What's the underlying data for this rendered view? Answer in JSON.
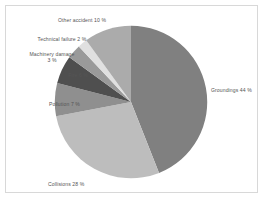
{
  "chart_data": {
    "type": "pie",
    "title": "",
    "subtitle": "",
    "xlabel": "",
    "ylabel": "",
    "legend_position": "none",
    "grid": false,
    "units": "%",
    "start_angle_deg": 0,
    "direction": "clockwise",
    "categories": [
      "Groundings",
      "Collisions",
      "Pollution",
      "Fire",
      "Machinery damage",
      "Technical failure",
      "Other accident"
    ],
    "values": [
      44,
      28,
      7,
      6,
      3,
      2,
      10
    ],
    "slices": [
      {
        "name": "Groundings",
        "value": 44,
        "label": "Groundings 44 %",
        "color": "#808080"
      },
      {
        "name": "Collisions",
        "value": 28,
        "label": "Collisions 28 %",
        "color": "#bdbdbd"
      },
      {
        "name": "Pollution",
        "value": 7,
        "label": "Pollution 7 %",
        "color": "#8f8f8f"
      },
      {
        "name": "Fire",
        "value": 6,
        "label": "Fire 6 %",
        "color": "#4f4f4f"
      },
      {
        "name": "Machinery damage",
        "value": 3,
        "label": "Machinery damage 3 %",
        "color": "#9a9a9a"
      },
      {
        "name": "Technical failure",
        "value": 2,
        "label": "Technical failure 2 %",
        "color": "#e0e0e0"
      },
      {
        "name": "Other accident",
        "value": 10,
        "label": "Other accident 10 %",
        "color": "#ababab"
      }
    ]
  },
  "labels": {
    "groundings": "Groundings 44 %",
    "collisions": "Collisions 28 %",
    "pollution": "Pollution 7 %",
    "fire": "Fire 6 %",
    "machinery_damage_line1": "Machinery damage",
    "machinery_damage_line2": "3 %",
    "technical_failure": "Technical failure 2 %",
    "other_accident": "Other accident 10 %"
  },
  "colors": {
    "frame_border": "#d8d8d8",
    "background": "#ffffff",
    "label_text": "#555555"
  }
}
